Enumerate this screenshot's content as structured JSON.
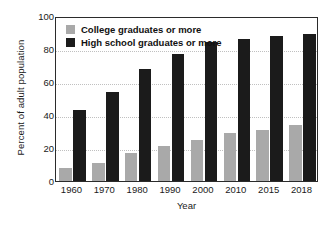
{
  "chart_data": {
    "type": "bar",
    "title": "",
    "subtitle": "",
    "xlabel": "Year",
    "ylabel": "Percent of adult population",
    "categories": [
      "1960",
      "1970",
      "1980",
      "1990",
      "2000",
      "2010",
      "2015",
      "2018"
    ],
    "series": [
      {
        "name": "College graduates or more",
        "color": "#a9a9a9",
        "values": [
          8,
          11,
          17,
          21,
          25,
          29,
          31,
          34
        ]
      },
      {
        "name": "High school graduates or more",
        "color": "#1b1b1b",
        "values": [
          43,
          54,
          68,
          77,
          84,
          86,
          88,
          89
        ]
      }
    ],
    "ylim": [
      0,
      100
    ],
    "yticks": [
      0,
      20,
      40,
      60,
      80,
      100
    ],
    "ytick_labels": [
      "0",
      "20",
      "40",
      "60",
      "80",
      "100"
    ],
    "gridlines": [
      20,
      40,
      60,
      80
    ],
    "grid": true,
    "grid_style": "dotted",
    "grid_color": "#c0c0c0",
    "legend_position": "top-left",
    "frame_color": "#2b2b2b",
    "background": "#ffffff"
  },
  "legend": {
    "items": [
      {
        "label": "College graduates or more",
        "swatch": "college"
      },
      {
        "label": "High school graduates or more",
        "swatch": "highschool"
      }
    ]
  }
}
